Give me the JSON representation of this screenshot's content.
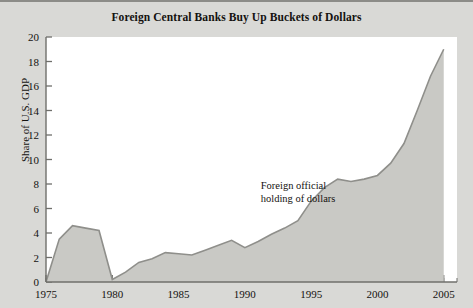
{
  "chart_data": {
    "type": "area",
    "title": "Foreign Central Banks Buy Up Buckets of Dollars",
    "xlabel": "",
    "ylabel": "Share of U.S. GDP",
    "xlim": [
      1975,
      2006
    ],
    "ylim": [
      0,
      20
    ],
    "ytick_step": 2,
    "xtick_step": 5,
    "x_minor_tick_step": 1,
    "grid": false,
    "legend": "none",
    "annotations": [
      {
        "name": "series-label",
        "line1": "Foreign official",
        "line2": "holding of dollars",
        "x": 1991.2,
        "y": 7.6
      }
    ],
    "yticks": [
      "0",
      "2",
      "4",
      "6",
      "8",
      "10",
      "12",
      "14",
      "16",
      "18",
      "20"
    ],
    "xticks": [
      "1975",
      "1980",
      "1985",
      "1990",
      "1995",
      "2000",
      "2005"
    ],
    "series": [
      {
        "name": "Foreign official holding of dollars",
        "fill_color": "#c9c9c5",
        "line_color": "#8f8f8b",
        "x": [
          1975,
          1976,
          1977,
          1978,
          1979,
          1980,
          1981,
          1982,
          1983,
          1984,
          1985,
          1986,
          1987,
          1988,
          1989,
          1990,
          1991,
          1992,
          1993,
          1994,
          1995,
          1996,
          1997,
          1998,
          1999,
          2000,
          2001,
          2002,
          2003,
          2004,
          2005
        ],
        "values": [
          0.0,
          3.5,
          4.6,
          4.4,
          4.2,
          0.2,
          0.8,
          1.6,
          1.9,
          2.4,
          2.3,
          2.2,
          2.6,
          3.0,
          3.4,
          2.8,
          3.3,
          3.9,
          4.4,
          5.0,
          6.6,
          7.7,
          8.4,
          8.2,
          8.4,
          8.7,
          9.7,
          11.3,
          14.0,
          16.8,
          19.0
        ]
      }
    ],
    "colors": {
      "page_background": "#d9d9d6",
      "plot_background": "#ffffff",
      "axis": "#6f6f6b",
      "text": "#14120f"
    }
  }
}
